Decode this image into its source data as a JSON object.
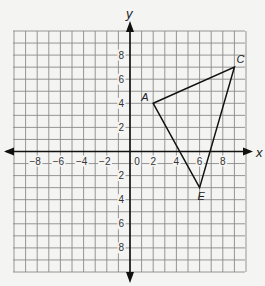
{
  "diagram": {
    "type": "coordinate-plane",
    "x_axis_label": "x",
    "y_axis_label": "y",
    "x_range": [
      -10,
      10
    ],
    "y_range": [
      -10,
      10
    ],
    "x_tick_labels": [
      "-8",
      "-6",
      "-4",
      "-2",
      "0",
      "2",
      "4",
      "6",
      "8"
    ],
    "x_tick_values": [
      -8,
      -6,
      -4,
      -2,
      0,
      2,
      4,
      6,
      8
    ],
    "y_tick_labels": [
      "8",
      "6",
      "4",
      "2",
      "2",
      "4",
      "6",
      "8"
    ],
    "y_tick_values": [
      8,
      6,
      4,
      2,
      -2,
      -4,
      -6,
      -8
    ],
    "points": [
      {
        "label": "A",
        "x": 2,
        "y": 4
      },
      {
        "label": "C",
        "x": 9,
        "y": 7
      },
      {
        "label": "E",
        "x": 6,
        "y": -3
      }
    ],
    "shape": "triangle ACE",
    "colors": {
      "background": "#f4f4f2",
      "grid": "#8a8a8a",
      "axis": "#111111",
      "triangle": "#111111"
    }
  }
}
